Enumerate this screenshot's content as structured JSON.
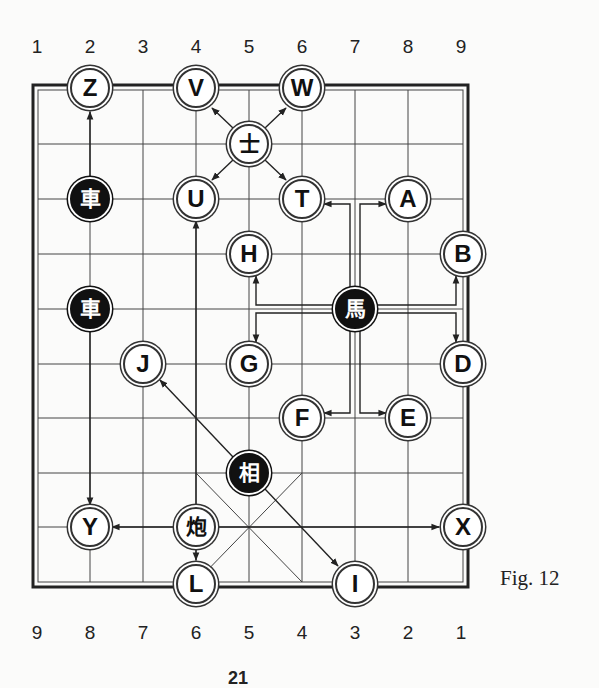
{
  "figure": {
    "caption": "Fig. 12",
    "page_number": "21",
    "top_file_labels": [
      "1",
      "2",
      "3",
      "4",
      "5",
      "6",
      "7",
      "8",
      "9"
    ],
    "bottom_file_labels": [
      "9",
      "8",
      "7",
      "6",
      "5",
      "4",
      "3",
      "2",
      "1"
    ]
  },
  "colors": {
    "line": "#333333",
    "black_piece": "#111111",
    "background": "#fbfbfa"
  },
  "pieces": {
    "black_chariot_1": {
      "char": "車",
      "kind": "black",
      "col": 1,
      "row": 2
    },
    "black_chariot_2": {
      "char": "車",
      "kind": "black",
      "col": 1,
      "row": 4
    },
    "black_horse": {
      "char": "馬",
      "kind": "black",
      "col": 6,
      "row": 4
    },
    "black_elephant": {
      "char": "相",
      "kind": "black",
      "col": 4,
      "row": 7
    },
    "advisor": {
      "char": "士",
      "kind": "red",
      "col": 4,
      "row": 1
    },
    "cannon": {
      "char": "炮",
      "kind": "red",
      "col": 3,
      "row": 8
    }
  },
  "targets": {
    "Z": {
      "label": "Z",
      "col": 1,
      "row": 0
    },
    "V": {
      "label": "V",
      "col": 3,
      "row": 0
    },
    "W": {
      "label": "W",
      "col": 5,
      "row": 0
    },
    "U": {
      "label": "U",
      "col": 3,
      "row": 2
    },
    "T": {
      "label": "T",
      "col": 5,
      "row": 2
    },
    "A": {
      "label": "A",
      "col": 7,
      "row": 2
    },
    "H": {
      "label": "H",
      "col": 4,
      "row": 3
    },
    "B": {
      "label": "B",
      "col": 8,
      "row": 3
    },
    "G": {
      "label": "G",
      "col": 4,
      "row": 5
    },
    "J": {
      "label": "J",
      "col": 2,
      "row": 5
    },
    "D": {
      "label": "D",
      "col": 8,
      "row": 5
    },
    "F": {
      "label": "F",
      "col": 5,
      "row": 6
    },
    "E": {
      "label": "E",
      "col": 7,
      "row": 6
    },
    "Y": {
      "label": "Y",
      "col": 1,
      "row": 8
    },
    "X": {
      "label": "X",
      "col": 8,
      "row": 8
    },
    "L": {
      "label": "L",
      "col": 3,
      "row": 9
    },
    "I": {
      "label": "I",
      "col": 6,
      "row": 9
    }
  }
}
